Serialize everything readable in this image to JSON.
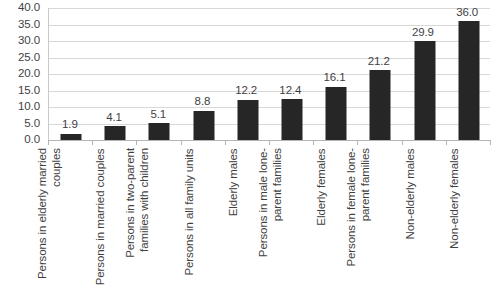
{
  "chart_data": {
    "type": "bar",
    "title": "",
    "subtitle": "",
    "xlabel": "",
    "ylabel": "",
    "ylim": [
      0.0,
      40.0
    ],
    "ytick_step": 5.0,
    "ytick_labels": [
      "40.0",
      "35.0",
      "30.0",
      "25.0",
      "20.0",
      "15.0",
      "10.0",
      "5.0",
      "0.0"
    ],
    "ytick_values": [
      40.0,
      35.0,
      30.0,
      25.0,
      20.0,
      15.0,
      10.0,
      5.0,
      0.0
    ],
    "grid": true,
    "grid_axis": "y",
    "legend": false,
    "legend_position": "none",
    "orientation": "vertical",
    "bar_color": "#262626",
    "grid_color": "#d8d8d8",
    "axis_color": "#b4b4b4",
    "text_color": "#3f3f3f",
    "categories": [
      "Persons in elderly married couples",
      "Persons in married couples",
      "Persons in two-parent families with children",
      "Persons in all family units",
      "Elderly males",
      "Persons in male lone-parent families",
      "Elderly females",
      "Persons in female lone-parent families",
      "Non-elderly males",
      "Non-elderly females"
    ],
    "values": [
      1.9,
      4.1,
      5.1,
      8.8,
      12.2,
      12.4,
      16.1,
      21.2,
      29.9,
      36.0
    ],
    "data_labels": [
      "1.9",
      "4.1",
      "5.1",
      "8.8",
      "12.2",
      "12.4",
      "16.1",
      "21.2",
      "29.9",
      "36.0"
    ]
  }
}
